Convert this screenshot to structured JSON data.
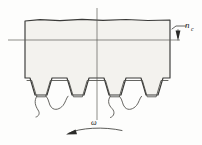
{
  "figure": {
    "labels": {
      "feed": "n",
      "feed_subscript": "c",
      "rotation": "ω"
    },
    "colors": {
      "outline": "#3a3a38",
      "fill": "#f3f2ee",
      "stipple": "#6e6d66",
      "axis": "#5d5c57",
      "arrow": "#2b2b29",
      "background": "#fdfdfc"
    },
    "geometry": {
      "body_left": 25,
      "body_right": 170,
      "body_top": 20,
      "tooth_root_y": 100,
      "tooth_count": 4,
      "axis_vertical_x": 97,
      "axis_horizontal_y": 40
    },
    "annotations": {
      "feed_arrow_direction": "down",
      "rotation_arrow_direction": "counterclockwise"
    }
  }
}
